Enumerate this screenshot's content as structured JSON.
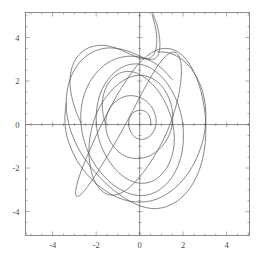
{
  "chart_data": {
    "type": "line",
    "title": "",
    "subtitle": "",
    "xlabel": "",
    "ylabel": "",
    "xlim": [
      -5.25,
      5.05
    ],
    "ylim": [
      -5.1,
      5.15
    ],
    "grid": false,
    "legend": null,
    "axes": {
      "x_ticks": [
        -4,
        -2,
        0,
        2,
        4
      ],
      "x_tick_labels": [
        "-4",
        "-2",
        "0",
        "2",
        "4"
      ],
      "y_ticks": [
        -4,
        -2,
        0,
        2,
        4
      ],
      "y_tick_labels": [
        "-4",
        "-2",
        "0",
        "2",
        "4"
      ],
      "x_minor_interval": 0.5,
      "y_minor_interval": 0.5,
      "zero_axes_drawn": true,
      "frame_drawn": true,
      "line_color": "#555555",
      "axis_color": "#707070",
      "frame_color": "#707070"
    },
    "series": [
      {
        "name": "trajectory",
        "color": "#555555",
        "width": 0.7,
        "points": [
          [
            0.52,
            0.0
          ],
          [
            0.5,
            0.2
          ],
          [
            0.45,
            0.38
          ],
          [
            0.36,
            0.52
          ],
          [
            0.22,
            0.62
          ],
          [
            0.05,
            0.66
          ],
          [
            -0.14,
            0.63
          ],
          [
            -0.3,
            0.54
          ],
          [
            -0.42,
            0.4
          ],
          [
            -0.49,
            0.22
          ],
          [
            -0.51,
            0.02
          ],
          [
            -0.47,
            -0.2
          ],
          [
            -0.38,
            -0.4
          ],
          [
            -0.24,
            -0.56
          ],
          [
            -0.06,
            -0.66
          ],
          [
            0.14,
            -0.68
          ],
          [
            0.34,
            -0.62
          ],
          [
            0.52,
            -0.48
          ],
          [
            0.66,
            -0.28
          ],
          [
            0.74,
            -0.04
          ],
          [
            0.76,
            0.22
          ],
          [
            0.7,
            0.5
          ],
          [
            0.58,
            0.76
          ],
          [
            0.4,
            0.99
          ],
          [
            0.16,
            1.17
          ],
          [
            -0.12,
            1.29
          ],
          [
            -0.42,
            1.33
          ],
          [
            -0.72,
            1.28
          ],
          [
            -1.0,
            1.14
          ],
          [
            -1.24,
            0.93
          ],
          [
            -1.42,
            0.66
          ],
          [
            -1.53,
            0.34
          ],
          [
            -1.56,
            0.0
          ],
          [
            -1.52,
            -0.35
          ],
          [
            -1.4,
            -0.69
          ],
          [
            -1.21,
            -1.0
          ],
          [
            -0.96,
            -1.26
          ],
          [
            -0.66,
            -1.45
          ],
          [
            -0.33,
            -1.55
          ],
          [
            0.02,
            -1.56
          ],
          [
            0.38,
            -1.47
          ],
          [
            0.72,
            -1.28
          ],
          [
            1.03,
            -1.0
          ],
          [
            1.28,
            -0.64
          ],
          [
            1.45,
            -0.22
          ],
          [
            1.52,
            0.24
          ],
          [
            1.49,
            0.72
          ],
          [
            1.36,
            1.18
          ],
          [
            1.14,
            1.6
          ],
          [
            0.84,
            1.94
          ],
          [
            0.48,
            2.17
          ],
          [
            0.08,
            2.26
          ],
          [
            -0.34,
            2.21
          ],
          [
            -0.76,
            2.02
          ],
          [
            -1.16,
            1.71
          ],
          [
            -1.52,
            1.3
          ],
          [
            -1.83,
            0.82
          ],
          [
            -2.07,
            0.29
          ],
          [
            -2.23,
            -0.28
          ],
          [
            -2.32,
            -0.86
          ],
          [
            -2.33,
            -1.44
          ],
          [
            -2.26,
            -1.99
          ],
          [
            -2.12,
            -2.48
          ],
          [
            -1.9,
            -2.88
          ],
          [
            -1.62,
            -3.14
          ],
          [
            -1.3,
            -3.24
          ],
          [
            -0.94,
            -3.18
          ],
          [
            -0.56,
            -2.96
          ],
          [
            -0.17,
            -2.6
          ],
          [
            0.22,
            -2.13
          ],
          [
            0.6,
            -1.57
          ],
          [
            0.96,
            -0.95
          ],
          [
            1.28,
            -0.28
          ],
          [
            1.54,
            0.42
          ],
          [
            1.74,
            1.12
          ],
          [
            1.87,
            1.8
          ],
          [
            1.92,
            2.42
          ],
          [
            1.88,
            2.92
          ],
          [
            1.74,
            3.24
          ],
          [
            1.52,
            3.33
          ],
          [
            1.24,
            3.18
          ],
          [
            0.92,
            2.82
          ],
          [
            0.58,
            2.3
          ],
          [
            0.22,
            1.66
          ],
          [
            -0.16,
            0.94
          ],
          [
            -0.56,
            0.18
          ],
          [
            -0.98,
            -0.58
          ],
          [
            -1.4,
            -1.3
          ],
          [
            -1.8,
            -1.96
          ],
          [
            -2.16,
            -2.52
          ],
          [
            -2.46,
            -2.94
          ],
          [
            -2.7,
            -3.21
          ],
          [
            -2.86,
            -3.3
          ],
          [
            -2.94,
            -3.2
          ],
          [
            -2.92,
            -2.92
          ],
          [
            -2.8,
            -2.46
          ],
          [
            -2.58,
            -1.86
          ],
          [
            -2.28,
            -1.14
          ],
          [
            -1.92,
            -0.34
          ],
          [
            -1.5,
            0.5
          ],
          [
            -1.06,
            1.32
          ],
          [
            -0.6,
            2.06
          ],
          [
            -0.14,
            2.68
          ],
          [
            0.32,
            3.14
          ],
          [
            0.78,
            3.42
          ],
          [
            1.24,
            3.5
          ],
          [
            1.68,
            3.38
          ],
          [
            2.08,
            3.06
          ],
          [
            2.42,
            2.56
          ],
          [
            2.7,
            1.92
          ],
          [
            2.9,
            1.18
          ],
          [
            3.02,
            0.38
          ],
          [
            3.04,
            -0.44
          ],
          [
            2.96,
            -1.24
          ],
          [
            2.78,
            -1.98
          ],
          [
            2.5,
            -2.62
          ],
          [
            2.14,
            -3.14
          ],
          [
            1.72,
            -3.52
          ],
          [
            1.26,
            -3.76
          ],
          [
            0.78,
            -3.86
          ],
          [
            0.3,
            -3.82
          ],
          [
            -0.18,
            -3.66
          ],
          [
            -0.66,
            -3.4
          ],
          [
            -1.14,
            -3.06
          ],
          [
            -1.62,
            -2.64
          ],
          [
            -2.08,
            -2.16
          ],
          [
            -2.5,
            -1.62
          ],
          [
            -2.86,
            -1.02
          ],
          [
            -3.14,
            -0.38
          ],
          [
            -3.32,
            0.3
          ],
          [
            -3.38,
            0.98
          ],
          [
            -3.32,
            1.64
          ],
          [
            -3.14,
            2.24
          ],
          [
            -2.84,
            2.76
          ],
          [
            -2.44,
            3.16
          ],
          [
            -1.96,
            3.42
          ],
          [
            -1.44,
            3.52
          ],
          [
            -0.92,
            3.48
          ],
          [
            -0.44,
            3.34
          ],
          [
            -0.02,
            3.16
          ],
          [
            0.34,
            3.02
          ],
          [
            0.62,
            3.0
          ],
          [
            0.82,
            3.14
          ],
          [
            0.92,
            3.46
          ],
          [
            0.92,
            3.92
          ],
          [
            0.84,
            4.42
          ],
          [
            0.7,
            4.86
          ],
          [
            0.58,
            5.15
          ]
        ]
      },
      {
        "name": "trajectory-inner-a",
        "color": "#555555",
        "width": 0.7,
        "points": [
          [
            -1.56,
            0.0
          ],
          [
            -1.68,
            0.46
          ],
          [
            -1.72,
            0.92
          ],
          [
            -1.66,
            1.38
          ],
          [
            -1.5,
            1.8
          ],
          [
            -1.24,
            2.14
          ],
          [
            -0.92,
            2.36
          ],
          [
            -0.56,
            2.44
          ],
          [
            -0.18,
            2.38
          ],
          [
            0.2,
            2.18
          ],
          [
            0.58,
            1.86
          ],
          [
            0.94,
            1.42
          ],
          [
            1.24,
            0.88
          ],
          [
            1.46,
            0.28
          ],
          [
            1.58,
            -0.34
          ],
          [
            1.58,
            -0.96
          ],
          [
            1.46,
            -1.52
          ],
          [
            1.24,
            -2.0
          ],
          [
            0.92,
            -2.38
          ],
          [
            0.54,
            -2.62
          ],
          [
            0.12,
            -2.7
          ],
          [
            -0.32,
            -2.62
          ],
          [
            -0.76,
            -2.38
          ],
          [
            -1.16,
            -2.0
          ],
          [
            -1.52,
            -1.5
          ],
          [
            -1.8,
            -0.9
          ],
          [
            -1.96,
            -0.26
          ],
          [
            -2.0,
            0.4
          ],
          [
            -1.92,
            1.04
          ],
          [
            -1.72,
            1.64
          ],
          [
            -1.4,
            2.14
          ],
          [
            -1.0,
            2.52
          ],
          [
            -0.54,
            2.74
          ],
          [
            -0.06,
            2.78
          ],
          [
            0.42,
            2.64
          ],
          [
            0.88,
            2.32
          ],
          [
            1.3,
            1.84
          ],
          [
            1.64,
            1.24
          ],
          [
            1.88,
            0.56
          ],
          [
            2.0,
            -0.16
          ],
          [
            2.0,
            -0.88
          ],
          [
            1.88,
            -1.56
          ],
          [
            1.64,
            -2.16
          ],
          [
            1.3,
            -2.66
          ],
          [
            0.88,
            -3.02
          ],
          [
            0.42,
            -3.22
          ],
          [
            -0.06,
            -3.26
          ],
          [
            -0.56,
            -3.14
          ],
          [
            -1.06,
            -2.88
          ],
          [
            -1.54,
            -2.48
          ],
          [
            -1.98,
            -1.96
          ],
          [
            -2.34,
            -1.34
          ],
          [
            -2.58,
            -0.66
          ],
          [
            -2.7,
            0.06
          ],
          [
            -2.68,
            0.78
          ],
          [
            -2.52,
            1.46
          ],
          [
            -2.22,
            2.08
          ],
          [
            -1.8,
            2.58
          ],
          [
            -1.28,
            2.94
          ],
          [
            -0.7,
            3.12
          ],
          [
            -0.1,
            3.12
          ],
          [
            0.48,
            2.94
          ],
          [
            1.02,
            2.58
          ],
          [
            1.5,
            2.06
          ]
        ]
      },
      {
        "name": "trajectory-outer-loop",
        "color": "#555555",
        "width": 0.7,
        "points": [
          [
            -2.7,
            0.06
          ],
          [
            -2.98,
            0.76
          ],
          [
            -3.16,
            1.46
          ],
          [
            -3.2,
            2.12
          ],
          [
            -3.08,
            2.72
          ],
          [
            -2.8,
            3.2
          ],
          [
            -2.36,
            3.52
          ],
          [
            -1.84,
            3.64
          ],
          [
            -1.3,
            3.58
          ],
          [
            -0.8,
            3.4
          ],
          [
            -0.36,
            3.2
          ],
          [
            0.0,
            3.06
          ],
          [
            0.3,
            3.02
          ],
          [
            0.54,
            3.1
          ],
          [
            0.7,
            3.32
          ],
          [
            0.78,
            3.68
          ],
          [
            0.78,
            4.12
          ],
          [
            0.7,
            4.58
          ],
          [
            0.58,
            5.02
          ]
        ]
      },
      {
        "name": "trajectory-outermost",
        "color": "#555555",
        "width": 0.7,
        "points": [
          [
            -3.38,
            0.98
          ],
          [
            -3.44,
            0.3
          ],
          [
            -3.38,
            -0.38
          ],
          [
            -3.18,
            -1.04
          ],
          [
            -2.88,
            -1.66
          ],
          [
            -2.48,
            -2.22
          ],
          [
            -2.02,
            -2.7
          ],
          [
            -1.52,
            -3.08
          ],
          [
            -1.0,
            -3.36
          ],
          [
            -0.46,
            -3.52
          ],
          [
            0.08,
            -3.56
          ],
          [
            0.62,
            -3.48
          ],
          [
            1.14,
            -3.26
          ],
          [
            1.62,
            -2.92
          ],
          [
            2.06,
            -2.46
          ],
          [
            2.44,
            -1.9
          ],
          [
            2.74,
            -1.26
          ],
          [
            2.94,
            -0.58
          ],
          [
            3.04,
            0.14
          ],
          [
            3.02,
            0.86
          ],
          [
            2.88,
            1.56
          ],
          [
            2.62,
            2.18
          ],
          [
            2.26,
            2.7
          ],
          [
            1.82,
            3.08
          ],
          [
            1.32,
            3.3
          ],
          [
            0.82,
            3.34
          ]
        ]
      }
    ]
  }
}
